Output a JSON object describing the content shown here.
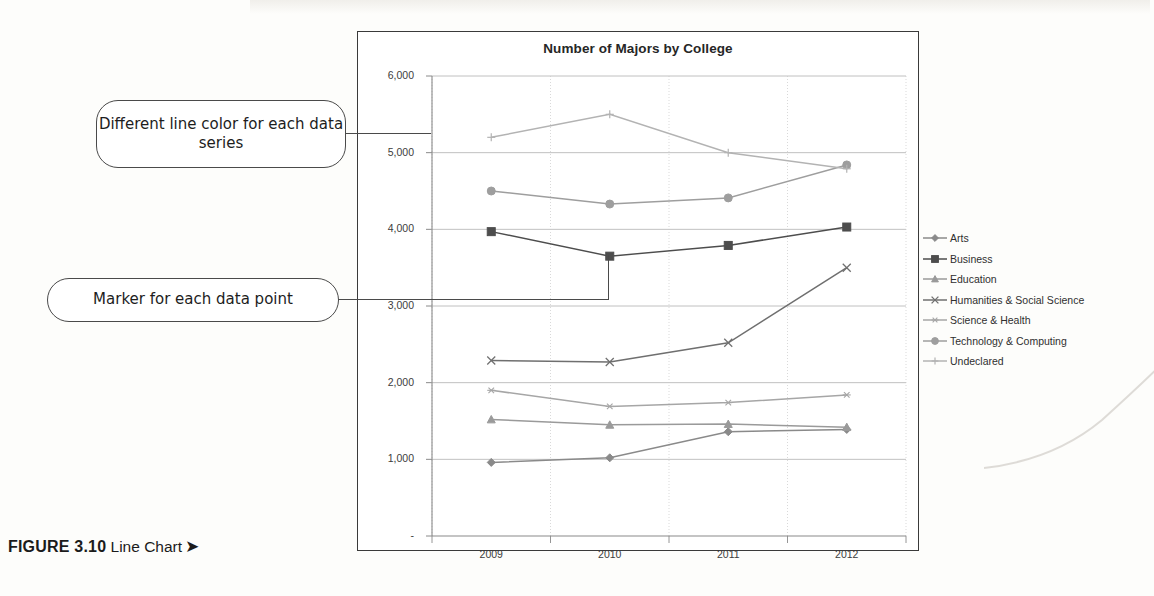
{
  "figure": {
    "label": "FIGURE 3.10",
    "caption": "Line Chart",
    "arrow": "➤"
  },
  "callouts": [
    {
      "id": "color",
      "text": "Different line color for each data series"
    },
    {
      "id": "marker",
      "text": "Marker for each data point"
    }
  ],
  "chart_data": {
    "type": "line",
    "title": "Number of Majors by College",
    "xlabel": "",
    "ylabel": "",
    "categories": [
      "2009",
      "2010",
      "2011",
      "2012"
    ],
    "ytick_labels": [
      "-",
      "1,000",
      "2,000",
      "3,000",
      "4,000",
      "5,000",
      "6,000"
    ],
    "ytick_values": [
      0,
      1000,
      2000,
      3000,
      4000,
      5000,
      6000
    ],
    "ylim": [
      0,
      6000
    ],
    "grid": true,
    "legend_position": "right",
    "series": [
      {
        "name": "Arts",
        "marker": "diamond",
        "color": "#8a8a8a",
        "values": [
          960,
          1020,
          1360,
          1390
        ]
      },
      {
        "name": "Business",
        "marker": "square",
        "color": "#4d4d4d",
        "values": [
          3970,
          3650,
          3790,
          4030
        ]
      },
      {
        "name": "Education",
        "marker": "triangle",
        "color": "#9a9a9a",
        "values": [
          1520,
          1450,
          1460,
          1420
        ]
      },
      {
        "name": "Humanities & Social Science",
        "marker": "x",
        "color": "#6f6f6f",
        "values": [
          2290,
          2270,
          2520,
          3500
        ]
      },
      {
        "name": "Science & Health",
        "marker": "asterisk",
        "color": "#a6a6a6",
        "values": [
          1900,
          1690,
          1740,
          1840
        ]
      },
      {
        "name": "Technology & Computing",
        "marker": "circle",
        "color": "#9e9e9e",
        "values": [
          4500,
          4330,
          4410,
          4840
        ]
      },
      {
        "name": "Undeclared",
        "marker": "plus",
        "color": "#b3b3b3",
        "values": [
          5200,
          5500,
          5000,
          4790
        ]
      }
    ]
  }
}
